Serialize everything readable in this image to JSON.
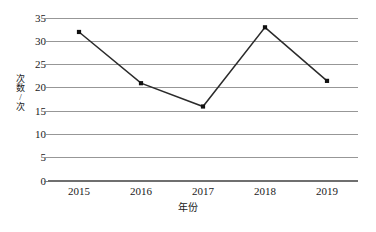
{
  "chart_data": {
    "type": "line",
    "title": "",
    "subtitle": "",
    "xlabel": "年份",
    "ylabel": "次数/次",
    "categories": [
      "2015",
      "2016",
      "2017",
      "2018",
      "2019"
    ],
    "values": [
      32,
      21,
      16,
      33,
      21.5
    ],
    "series": [
      {
        "name": "次数",
        "values": [
          32,
          21,
          16,
          33,
          21.5
        ]
      }
    ],
    "ylim": [
      0,
      35
    ],
    "ytick_labels": [
      "0",
      "5",
      "10",
      "15",
      "20",
      "25",
      "30",
      "35"
    ],
    "ytick_values": [
      0,
      5,
      10,
      15,
      20,
      25,
      30,
      35
    ],
    "grid": "horizontal-only",
    "legend": "none",
    "annotations": [],
    "colors": {
      "line": "#2b2b2b",
      "marker": "#111111",
      "gridline": "#8c8c8c",
      "background": "#ffffff",
      "text": "#1a1a1a"
    },
    "marker_style": "filled-square",
    "axis_line_visible": false
  }
}
